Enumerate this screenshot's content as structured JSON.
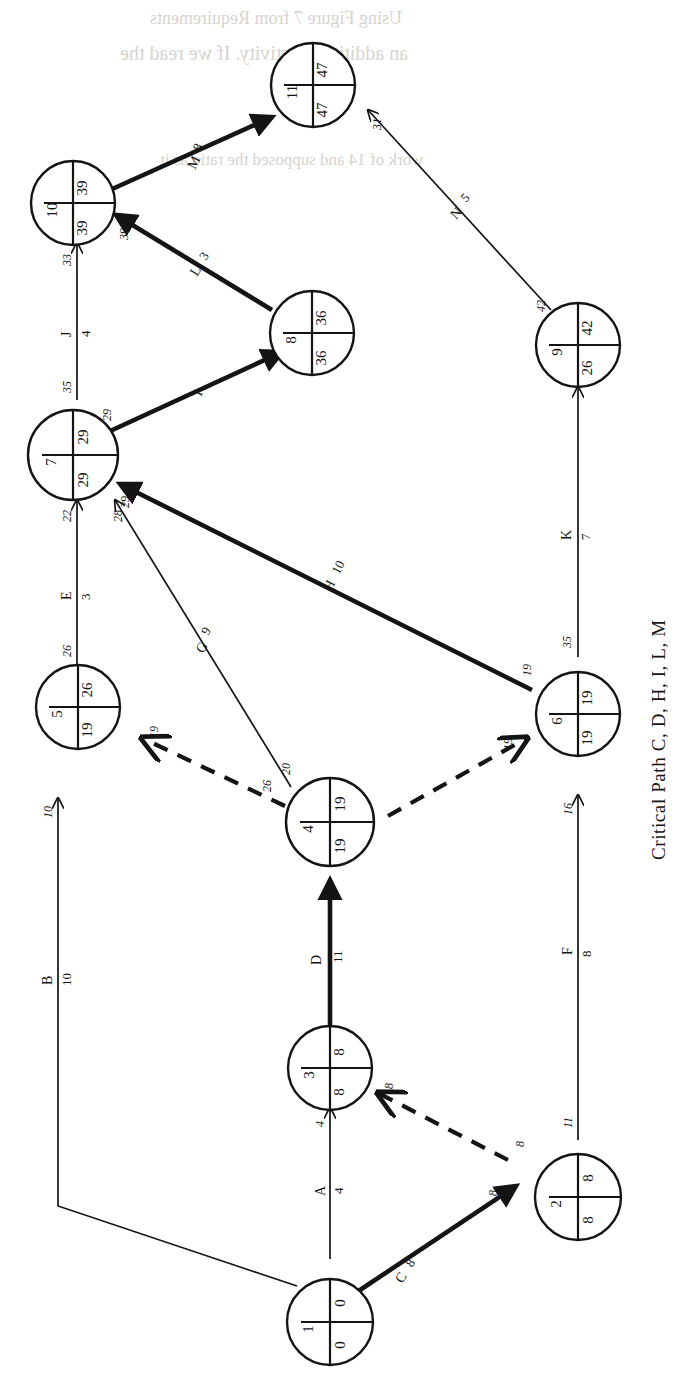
{
  "diagram": {
    "title_text": "Critical Path  C, D, H, I, L, M",
    "type": "CPM/PERT activity-on-arrow network",
    "orientation": "rotated 90 degrees counter-clockwise",
    "colors": {
      "ink": "#141414",
      "paper": "#ffffff",
      "bleed": "#d7d4cf"
    },
    "nodes": [
      {
        "id": "1",
        "number": "1",
        "early": "0",
        "late": "0"
      },
      {
        "id": "2",
        "number": "2",
        "early": "8",
        "late": "8"
      },
      {
        "id": "3",
        "number": "3",
        "early": "8",
        "late": "8"
      },
      {
        "id": "4",
        "number": "4",
        "early": "19",
        "late": "19"
      },
      {
        "id": "5",
        "number": "5",
        "early": "19",
        "late": "26"
      },
      {
        "id": "6",
        "number": "6",
        "early": "19",
        "late": "19"
      },
      {
        "id": "7",
        "number": "7",
        "early": "29",
        "late": "29"
      },
      {
        "id": "8",
        "number": "8",
        "early": "36",
        "late": "36"
      },
      {
        "id": "9",
        "number": "9",
        "early": "26",
        "late": "42"
      },
      {
        "id": "10",
        "number": "10",
        "early": "39",
        "late": "39"
      },
      {
        "id": "11",
        "number": "11",
        "early": "47",
        "late": "47"
      }
    ],
    "activities": [
      {
        "name": "A",
        "duration": "4",
        "from": "1",
        "to": "3",
        "critical": false,
        "dummy": false
      },
      {
        "name": "B",
        "duration": "10",
        "from": "1",
        "to": "5",
        "critical": false,
        "dummy": false
      },
      {
        "name": "C",
        "duration": "8",
        "from": "1",
        "to": "2",
        "critical": true,
        "dummy": false
      },
      {
        "name": "D",
        "duration": "11",
        "from": "3",
        "to": "4",
        "critical": true,
        "dummy": false
      },
      {
        "name": "E",
        "duration": "3",
        "from": "5",
        "to": "7",
        "critical": false,
        "dummy": false
      },
      {
        "name": "F",
        "duration": "8",
        "from": "2",
        "to": "6",
        "critical": false,
        "dummy": false
      },
      {
        "name": "G",
        "duration": "9",
        "from": "4",
        "to": "7",
        "critical": false,
        "dummy": false
      },
      {
        "name": "H",
        "duration": "10",
        "from": "6",
        "to": "7",
        "critical": true,
        "dummy": false
      },
      {
        "name": "I",
        "duration": "7",
        "from": "7",
        "to": "8",
        "critical": true,
        "dummy": false
      },
      {
        "name": "J",
        "duration": "4",
        "from": "7",
        "to": "10",
        "critical": false,
        "dummy": false
      },
      {
        "name": "K",
        "duration": "7",
        "from": "6",
        "to": "9",
        "critical": false,
        "dummy": false
      },
      {
        "name": "L",
        "duration": "3",
        "from": "8",
        "to": "10",
        "critical": true,
        "dummy": false
      },
      {
        "name": "M",
        "duration": "8",
        "from": "10",
        "to": "11",
        "critical": true,
        "dummy": false
      },
      {
        "name": "N",
        "duration": "5",
        "from": "9",
        "to": "11",
        "critical": false,
        "dummy": false
      }
    ],
    "dummies": [
      {
        "from": "2",
        "to": "3",
        "tail_time": "8",
        "head_time": "8"
      },
      {
        "from": "4",
        "to": "5",
        "tail_time": "26",
        "head_time": "19"
      },
      {
        "from": "4",
        "to": "6",
        "tail_time": "19",
        "head_time": "19"
      }
    ],
    "edge_time_tags": [
      {
        "id": "t-c-tail",
        "value": "8"
      },
      {
        "id": "t-a-head",
        "value": "4"
      },
      {
        "id": "t-b-head",
        "value": "10"
      },
      {
        "id": "t-f-tail",
        "value": "11"
      },
      {
        "id": "t-f-head",
        "value": "16"
      },
      {
        "id": "t-g-tail",
        "value": "20"
      },
      {
        "id": "t-g-head",
        "value": "28"
      },
      {
        "id": "t-e-tail",
        "value": "26"
      },
      {
        "id": "t-e-head",
        "value": "22"
      },
      {
        "id": "t-h-tail",
        "value": "19"
      },
      {
        "id": "t-h-head",
        "value": "29"
      },
      {
        "id": "t-i-tail",
        "value": "29"
      },
      {
        "id": "t-j-tail",
        "value": "35"
      },
      {
        "id": "t-j-head",
        "value": "33"
      },
      {
        "id": "t-l-head",
        "value": "39"
      },
      {
        "id": "t-m-head",
        "value": "47"
      },
      {
        "id": "t-k-tail",
        "value": "35"
      },
      {
        "id": "t-n-tail",
        "value": "42"
      },
      {
        "id": "t-n-head",
        "value": "31"
      },
      {
        "id": "t-dummy45-tail",
        "value": "26"
      },
      {
        "id": "t-dummy45-head",
        "value": "19"
      },
      {
        "id": "t-dummy46-tail",
        "value": "19"
      },
      {
        "id": "t-dummy46-head",
        "value": "19"
      },
      {
        "id": "t-dummy23-tail",
        "value": "8"
      },
      {
        "id": "t-dummy23-head",
        "value": "8"
      }
    ]
  },
  "bleed_text": {
    "line1": "Using Figure 7 from Requirements",
    "line2": "an additional activity. If we read the",
    "line3": "work of 14 and supposed the ratio as it"
  }
}
